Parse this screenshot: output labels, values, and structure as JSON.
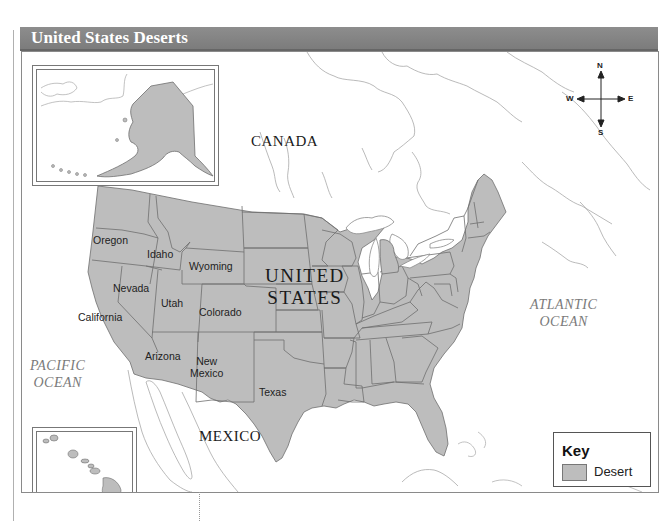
{
  "title": "United States Deserts",
  "colors": {
    "title_bar": "#858585",
    "desert_fill": "#bdbdbd",
    "state_border": "#6e6e6e",
    "coastline": "#9a9a9a",
    "ocean_label": "#7a7a7a"
  },
  "labels": {
    "countries": {
      "canada": "CANADA",
      "mexico": "MEXICO",
      "us_line1": "UNITED",
      "us_line2": "STATES"
    },
    "oceans": {
      "pacific_line1": "PACIFIC",
      "pacific_line2": "OCEAN",
      "atlantic_line1": "ATLANTIC",
      "atlantic_line2": "OCEAN"
    },
    "states": {
      "oregon": "Oregon",
      "idaho": "Idaho",
      "wyoming": "Wyoming",
      "nevada": "Nevada",
      "utah": "Utah",
      "colorado": "Colorado",
      "california": "California",
      "arizona": "Arizona",
      "new_mexico_line1": "New",
      "new_mexico_line2": "Mexico",
      "texas": "Texas"
    }
  },
  "insets": {
    "alaska": "Alaska inset",
    "hawaii": "Hawaii inset"
  },
  "compass": {
    "north": "N",
    "south": "S",
    "east": "E",
    "west": "W"
  },
  "key": {
    "title": "Key",
    "items": [
      {
        "label": "Desert",
        "color": "#bdbdbd"
      }
    ]
  }
}
